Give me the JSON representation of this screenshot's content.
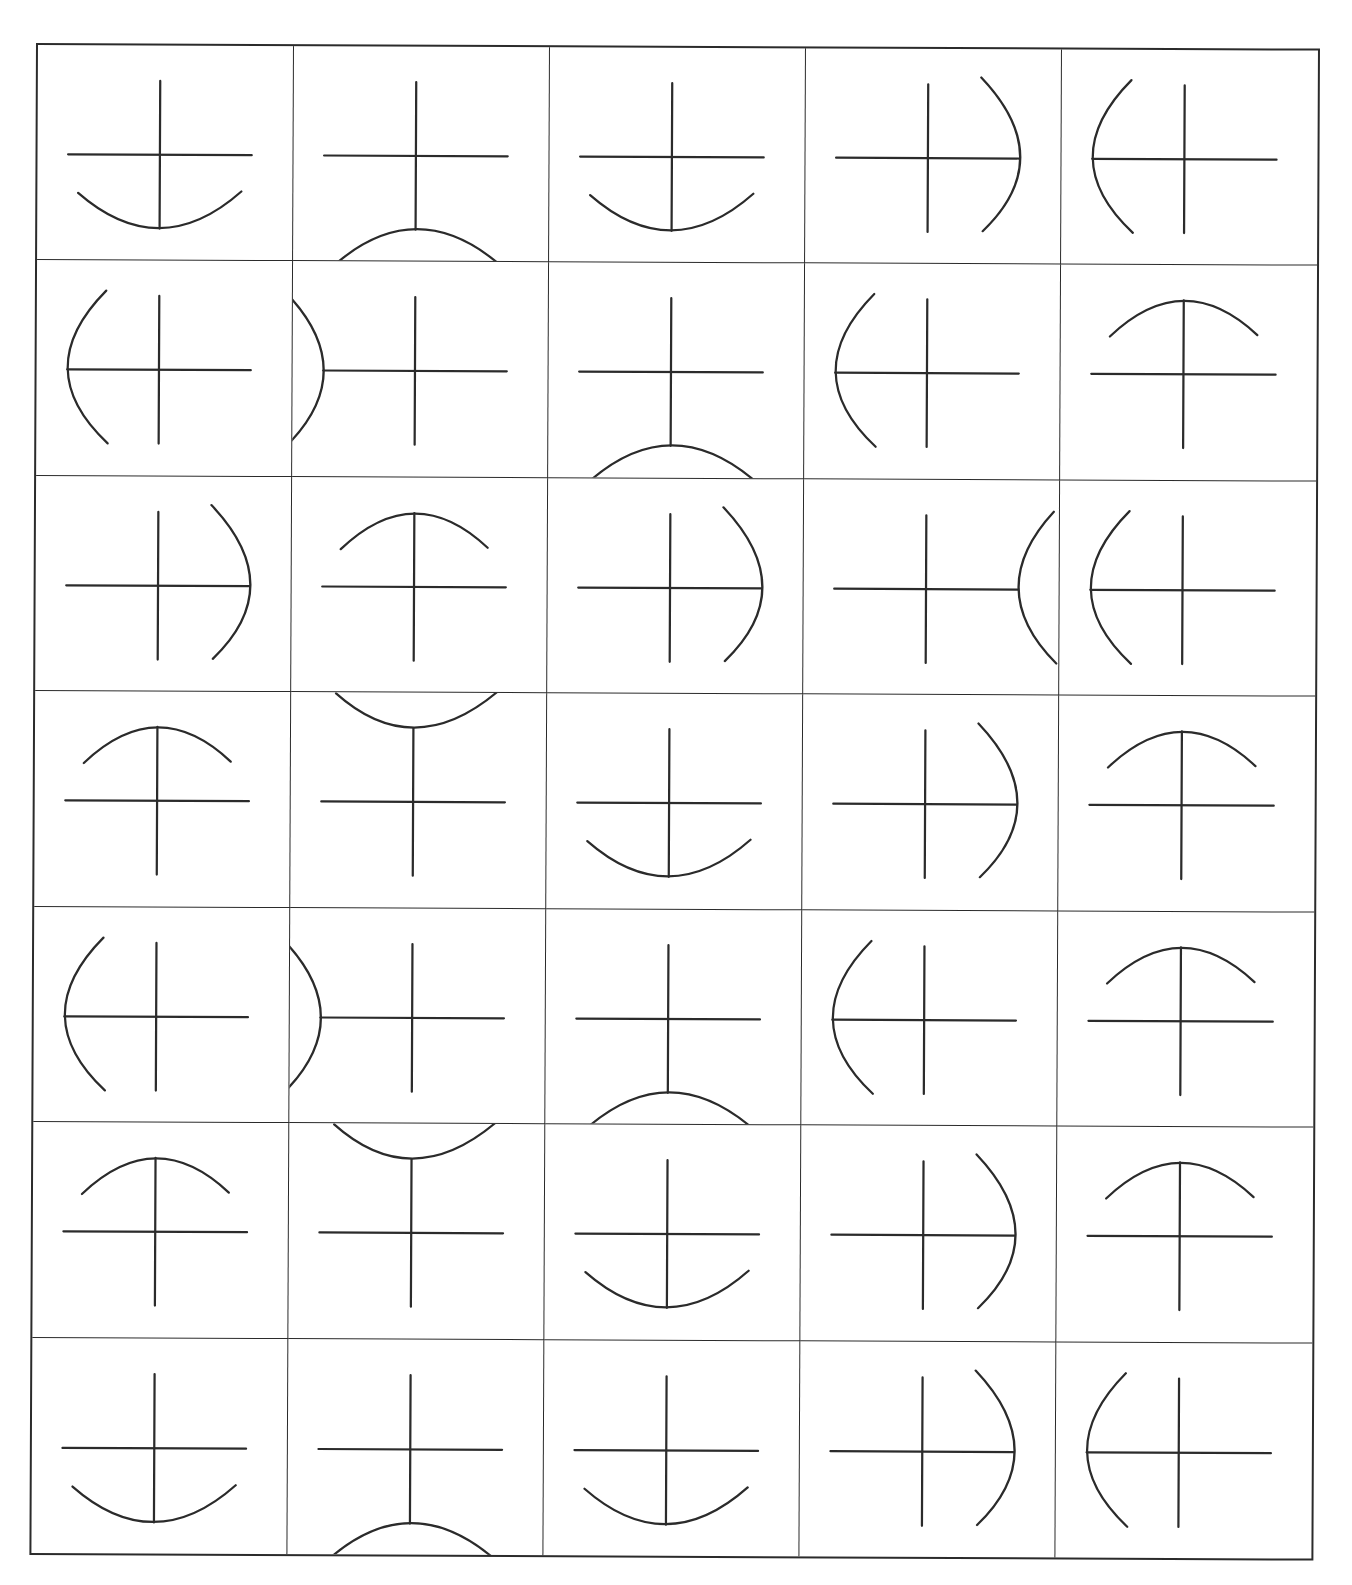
{
  "header": {
    "text": ""
  },
  "grid": {
    "rows": 7,
    "cols": 5,
    "line_color": "#2b2b2b",
    "cells": [
      [
        "down",
        "down-reversed",
        "down",
        "right",
        "left"
      ],
      [
        "left",
        "left-reversed",
        "down-reversed",
        "left",
        "up"
      ],
      [
        "right",
        "up",
        "right",
        "right-reversed",
        "left"
      ],
      [
        "up",
        "up-reversed",
        "down",
        "right",
        "up"
      ],
      [
        "left",
        "left-reversed",
        "down-reversed",
        "left",
        "up"
      ],
      [
        "up",
        "up-reversed",
        "down",
        "right",
        "up"
      ],
      [
        "down",
        "down-reversed",
        "down",
        "right",
        "left"
      ]
    ]
  }
}
